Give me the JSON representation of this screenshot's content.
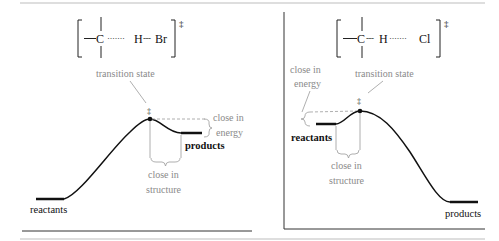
{
  "colors": {
    "ink": "#1a1a1a",
    "annotation": "#8a8a8a",
    "rule": "#bdbdbd",
    "axis": "#333333"
  },
  "left_panel": {
    "structure": {
      "atom1": "C",
      "bond1": "·······",
      "atom2": "H",
      "bond2": "---",
      "atom3": "Br",
      "superscript": "‡"
    },
    "transition_state_label": "transition state",
    "ts_marker": "‡",
    "energy_note_line1": "close in",
    "energy_note_line2": "energy",
    "structure_note_line1": "close in",
    "structure_note_line2": "structure",
    "reactants_label": "reactants",
    "products_label": "products"
  },
  "right_panel": {
    "structure": {
      "atom1": "C",
      "bond1": "---",
      "atom2": "H",
      "bond2": "·······",
      "atom3": "Cl",
      "superscript": "‡"
    },
    "transition_state_label": "transition state",
    "ts_marker": "‡",
    "energy_note_line1": "close in",
    "energy_note_line2": "energy",
    "structure_note_line1": "close in",
    "structure_note_line2": "structure",
    "reactants_label": "reactants",
    "products_label": "products"
  }
}
